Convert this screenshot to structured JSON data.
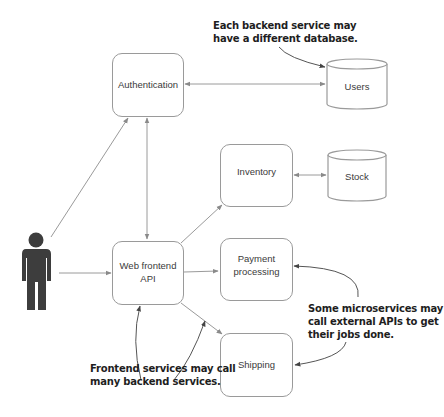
{
  "diagram": {
    "type": "microservices-architecture",
    "actor": {
      "name": "user-figure"
    },
    "services": {
      "authentication": "Authentication",
      "web_frontend_line1": "Web frontend",
      "web_frontend_line2": "API",
      "inventory": "Inventory",
      "payment_line1": "Payment",
      "payment_line2": "processing",
      "shipping": "Shipping"
    },
    "databases": {
      "users": "Users",
      "stock": "Stock"
    },
    "annotations": {
      "database_note_line1": "Each backend service may",
      "database_note_line2": "have a different database.",
      "external_note_line1": "Some microservices may",
      "external_note_line2": "call external APIs to get",
      "external_note_line3": "their jobs done.",
      "frontend_note_line1": "Frontend services may call",
      "frontend_note_line2": "many backend services."
    },
    "connections": [
      {
        "from": "User",
        "to": "Authentication"
      },
      {
        "from": "User",
        "to": "Web frontend API"
      },
      {
        "from": "Web frontend API",
        "to": "Authentication",
        "bidirectional": true
      },
      {
        "from": "Authentication",
        "to": "Users",
        "bidirectional": true
      },
      {
        "from": "Web frontend API",
        "to": "Inventory"
      },
      {
        "from": "Inventory",
        "to": "Stock",
        "bidirectional": true
      },
      {
        "from": "Web frontend API",
        "to": "Payment processing"
      },
      {
        "from": "Web frontend API",
        "to": "Shipping"
      }
    ],
    "colors": {
      "box_border": "#9a9a9a",
      "line": "#9a9a9a",
      "figure": "#3d3d3d",
      "note_text": "#1e1e1e"
    }
  }
}
